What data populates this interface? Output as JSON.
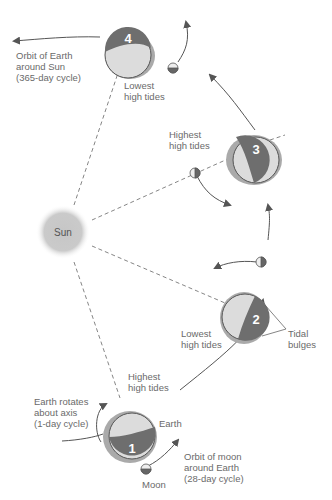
{
  "diagram": {
    "sun": {
      "label": "Sun",
      "color": "#c8c8c8"
    },
    "positions": [
      {
        "number": "1",
        "tide_label": "Highest\nhigh tides"
      },
      {
        "number": "2",
        "tide_label": "Lowest\nhigh tides"
      },
      {
        "number": "3",
        "tide_label": "Highest\nhigh tides"
      },
      {
        "number": "4",
        "tide_label": "Lowest\nhigh tides"
      }
    ],
    "labels": {
      "earth_orbit": "Orbit of Earth\naround Sun\n(365-day cycle)",
      "earth_rotation": "Earth rotates\nabout axis\n(1-day cycle)",
      "earth": "Earth",
      "moon": "Moon",
      "moon_orbit": "Orbit of moon\naround Earth\n(28-day cycle)",
      "tidal_bulges": "Tidal\nbulges"
    },
    "colors": {
      "earth_dark": "#6e6e6e",
      "earth_light": "#dcdcdc",
      "bulge": "#a8a8a8",
      "line": "#666666"
    }
  }
}
